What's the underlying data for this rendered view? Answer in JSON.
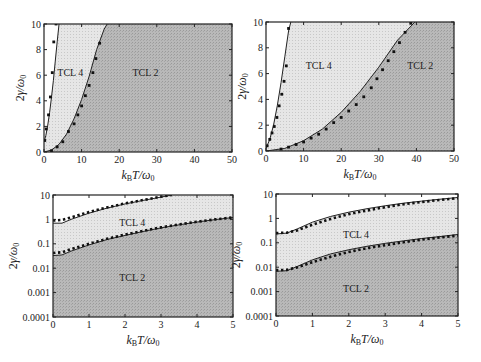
{
  "figure": {
    "colors": {
      "background": "#ffffff",
      "tcl2_fill": "#b4b4b4",
      "tcl4_fill": "#e2e2e2",
      "line": "#222222",
      "frame": "#222222"
    }
  },
  "chart_data": [
    {
      "id": "top-left",
      "type": "area",
      "xscale": "linear",
      "yscale": "linear",
      "xlabel": "k_B T/ω_0",
      "ylabel": "2γ/ω_0",
      "xlim": [
        0,
        50
      ],
      "ylim": [
        0,
        10
      ],
      "xticks": [
        0,
        10,
        20,
        30,
        40,
        50
      ],
      "xtick_labels": [
        "0",
        "10",
        "20",
        "30",
        "40",
        "50"
      ],
      "yticks": [
        0,
        2,
        4,
        6,
        8,
        10
      ],
      "ytick_labels": [
        "0",
        "2",
        "4",
        "6",
        "8",
        "10"
      ],
      "grid": false,
      "frame": {
        "x": 44,
        "y": 24,
        "w": 188,
        "h": 128
      },
      "region_labels": [
        {
          "text": "TCL 4",
          "x": 7,
          "y": 6.2
        },
        {
          "text": "TCL 2",
          "x": 27,
          "y": 6.2
        }
      ],
      "series": [
        {
          "name": "TCL 4 boundary (line)",
          "x": [
            0,
            0.5,
            1,
            1.5,
            2,
            2.5,
            3,
            3.5,
            4
          ],
          "y": [
            0.8,
            1.3,
            2.1,
            3.1,
            4.3,
            5.6,
            7.1,
            8.6,
            10
          ]
        },
        {
          "name": "TCL 4 boundary (points)",
          "x": [
            0.2,
            0.6,
            1.2,
            1.7,
            2.2,
            2.6,
            3.2
          ],
          "y": [
            0.9,
            1.8,
            2.9,
            4.3,
            6.2,
            8.6,
            10
          ]
        },
        {
          "name": "TCL 2 boundary (line)",
          "x": [
            0,
            2,
            4,
            6,
            8,
            10,
            12,
            14,
            16,
            16.8
          ],
          "y": [
            0,
            0.15,
            0.6,
            1.4,
            2.6,
            4.1,
            5.9,
            8.0,
            9.6,
            10
          ]
        },
        {
          "name": "TCL 2 boundary (points)",
          "x": [
            2,
            3.5,
            5,
            6.5,
            8,
            9,
            10,
            11,
            12,
            13,
            13.8,
            14.8
          ],
          "y": [
            0.1,
            0.4,
            0.8,
            1.6,
            2.2,
            2.9,
            3.6,
            4.4,
            5.2,
            6.2,
            7.3,
            8.5
          ]
        }
      ]
    },
    {
      "id": "top-right",
      "type": "area",
      "xscale": "linear",
      "yscale": "linear",
      "xlabel": "k_B T/ω_0",
      "ylabel": "2γ/ω_0",
      "xlim": [
        0,
        50
      ],
      "ylim": [
        0,
        10
      ],
      "xticks": [
        0,
        10,
        20,
        30,
        40,
        50
      ],
      "xtick_labels": [
        "0",
        "10",
        "20",
        "30",
        "40",
        "50"
      ],
      "yticks": [
        0,
        2,
        4,
        6,
        8,
        10
      ],
      "ytick_labels": [
        "0",
        "2",
        "4",
        "6",
        "8",
        "10"
      ],
      "grid": false,
      "frame": {
        "x": 266,
        "y": 22,
        "w": 188,
        "h": 129
      },
      "region_labels": [
        {
          "text": "TCL 4",
          "x": 14,
          "y": 6.6
        },
        {
          "text": "TCL 2",
          "x": 41,
          "y": 6.6
        }
      ],
      "series": [
        {
          "name": "TCL 4 boundary (line)",
          "x": [
            0,
            1,
            2,
            3,
            4,
            5,
            6,
            6.6
          ],
          "y": [
            0.2,
            0.9,
            2.0,
            3.5,
            5.3,
            7.3,
            9.3,
            10
          ]
        },
        {
          "name": "TCL 4 boundary (points)",
          "x": [
            0.3,
            1,
            1.6,
            2.2,
            2.9,
            3.5,
            4.2,
            4.8,
            5.4,
            6.0
          ],
          "y": [
            0.4,
            0.9,
            1.4,
            1.9,
            2.6,
            3.5,
            4.4,
            5.4,
            6.6,
            9.5
          ]
        },
        {
          "name": "TCL 2 boundary (line)",
          "x": [
            0,
            5,
            10,
            15,
            20,
            25,
            30,
            35,
            39.6
          ],
          "y": [
            0,
            0.2,
            0.8,
            1.7,
            3.0,
            4.6,
            6.5,
            8.6,
            10
          ]
        },
        {
          "name": "TCL 2 boundary (points)",
          "x": [
            4,
            6,
            8,
            10,
            12,
            14,
            16,
            18,
            20,
            22,
            24,
            26,
            28,
            29.5,
            31,
            32.5,
            34,
            35.5,
            37,
            38.5
          ],
          "y": [
            0.15,
            0.3,
            0.5,
            0.7,
            1.0,
            1.3,
            1.7,
            2.2,
            2.6,
            3.1,
            3.6,
            4.2,
            4.9,
            5.6,
            6.3,
            7.0,
            7.7,
            8.4,
            9.2,
            9.9
          ]
        }
      ]
    },
    {
      "id": "bottom-left",
      "type": "area",
      "xscale": "linear",
      "yscale": "log",
      "xlabel": "k_B T/ω_0",
      "ylabel": "2γ/ω_0",
      "xlim": [
        0,
        5
      ],
      "ylim": [
        0.0001,
        10
      ],
      "xticks": [
        0,
        1,
        2,
        3,
        4,
        5
      ],
      "xtick_labels": [
        "0",
        "1",
        "2",
        "3",
        "4",
        "5"
      ],
      "yticks": [
        0.0001,
        0.001,
        0.01,
        0.1,
        1,
        10
      ],
      "ytick_labels": [
        "0.0001",
        "0.001",
        "0.01",
        "0.1",
        "1",
        "10"
      ],
      "grid": false,
      "frame": {
        "x": 53,
        "y": 195,
        "w": 180,
        "h": 122
      },
      "region_labels": [
        {
          "text": "TCL 4",
          "x": 2.2,
          "y": 0.7
        },
        {
          "text": "TCL 2",
          "x": 2.2,
          "y": 0.004
        }
      ],
      "series": [
        {
          "name": "TCL 4 boundary (line)",
          "x": [
            0,
            0.25,
            0.5,
            1,
            1.5,
            2,
            2.5,
            3,
            3.3
          ],
          "y": [
            0.7,
            0.7,
            1.0,
            1.8,
            2.9,
            4.3,
            6.0,
            8.2,
            10
          ]
        },
        {
          "name": "TCL 4 boundary (points)",
          "x": [
            0,
            0.25,
            0.5,
            1,
            1.5,
            2,
            2.5,
            3,
            3.3
          ],
          "y": [
            0.9,
            0.95,
            1.2,
            2.0,
            3.1,
            4.5,
            6.2,
            8.5,
            10
          ]
        },
        {
          "name": "TCL 2 boundary (line)",
          "x": [
            0,
            0.25,
            0.5,
            1,
            1.5,
            2,
            2.5,
            3,
            3.5,
            4,
            4.5,
            5
          ],
          "y": [
            0.033,
            0.035,
            0.05,
            0.09,
            0.15,
            0.22,
            0.32,
            0.45,
            0.6,
            0.78,
            0.98,
            1.2
          ]
        },
        {
          "name": "TCL 2 boundary (points)",
          "x": [
            0,
            0.25,
            0.5,
            1,
            1.5,
            2,
            2.5,
            3,
            3.5,
            4,
            4.5,
            5
          ],
          "y": [
            0.042,
            0.045,
            0.06,
            0.1,
            0.16,
            0.24,
            0.34,
            0.47,
            0.62,
            0.8,
            1.0,
            1.2
          ]
        }
      ]
    },
    {
      "id": "bottom-right",
      "type": "area",
      "xscale": "linear",
      "yscale": "log",
      "xlabel": "k_B T/ω_0",
      "ylabel": "2γ/ω_0",
      "xlim": [
        0,
        5
      ],
      "ylim": [
        0.0001,
        10
      ],
      "xticks": [
        0,
        1,
        2,
        3,
        4,
        5
      ],
      "xtick_labels": [
        "0",
        "1",
        "2",
        "3",
        "4",
        "5"
      ],
      "yticks": [
        0.0001,
        0.001,
        0.01,
        0.1,
        1,
        10
      ],
      "ytick_labels": [
        "0.0001",
        "0.001",
        "0.01",
        "0.1",
        "1",
        "10"
      ],
      "grid": false,
      "frame": {
        "x": 276,
        "y": 194,
        "w": 182,
        "h": 122
      },
      "region_labels": [
        {
          "text": "TCL 4",
          "x": 2.2,
          "y": 0.2
        },
        {
          "text": "TCL 2",
          "x": 2.2,
          "y": 0.0013
        }
      ],
      "series": [
        {
          "name": "TCL 4 boundary (line)",
          "x": [
            0,
            0.3,
            0.6,
            1,
            1.5,
            2,
            2.5,
            3,
            3.5,
            4,
            4.5,
            5
          ],
          "y": [
            0.23,
            0.25,
            0.38,
            0.7,
            1.2,
            1.8,
            2.5,
            3.3,
            4.2,
            5.1,
            6.1,
            7.2
          ]
        },
        {
          "name": "TCL 4 boundary (points)",
          "x": [
            0,
            0.3,
            0.6,
            1,
            1.5,
            2,
            2.5,
            3,
            3.5,
            4,
            4.5,
            5
          ],
          "y": [
            0.25,
            0.26,
            0.33,
            0.55,
            0.95,
            1.5,
            2.1,
            2.9,
            3.8,
            4.7,
            5.7,
            6.8
          ]
        },
        {
          "name": "TCL 2 boundary (line)",
          "x": [
            0,
            0.3,
            0.6,
            1,
            1.5,
            2,
            2.5,
            3,
            3.5,
            4,
            4.5,
            5
          ],
          "y": [
            0.0068,
            0.0072,
            0.011,
            0.02,
            0.035,
            0.052,
            0.072,
            0.095,
            0.12,
            0.15,
            0.18,
            0.22
          ]
        },
        {
          "name": "TCL 2 boundary (points)",
          "x": [
            0,
            0.3,
            0.6,
            1,
            1.5,
            2,
            2.5,
            3,
            3.5,
            4,
            4.5,
            5
          ],
          "y": [
            0.0075,
            0.0078,
            0.01,
            0.016,
            0.027,
            0.042,
            0.06,
            0.08,
            0.105,
            0.135,
            0.165,
            0.2
          ]
        }
      ]
    }
  ]
}
